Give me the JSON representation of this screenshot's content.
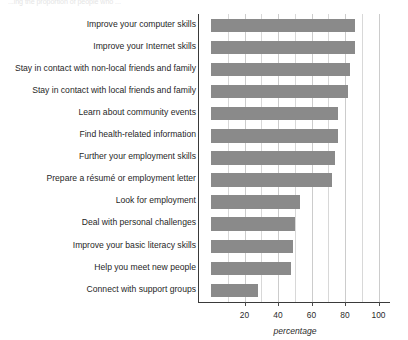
{
  "top_caption": "...ing the proportion of people who ...",
  "chart_data": {
    "type": "bar",
    "orientation": "horizontal",
    "title": "",
    "xlabel": "percentage",
    "ylabel": "",
    "xlim": [
      0,
      108
    ],
    "xticks": [
      20,
      40,
      60,
      80,
      100
    ],
    "gridlines": [
      10,
      20,
      30,
      40,
      50,
      60,
      70,
      80,
      90,
      100
    ],
    "grid": true,
    "legend": "none",
    "bar_color": "#8a8a8a",
    "categories": [
      "Improve your computer skills",
      "Improve your Internet skills",
      "Stay in contact with non-local friends and family",
      "Stay in contact with local friends and family",
      "Learn about community events",
      "Find health-related information",
      "Further your employment skills",
      "Prepare a résumé or employment letter",
      "Look for employment",
      "Deal with personal challenges",
      "Improve your basic literacy skills",
      "Help you meet new people",
      "Connect with support groups"
    ],
    "values": [
      86,
      86,
      83,
      82,
      76,
      76,
      74,
      72,
      53,
      50,
      49,
      48,
      28
    ]
  },
  "axis": {
    "tick_labels": [
      "20",
      "40",
      "60",
      "80",
      "100"
    ],
    "x_title": "percentage"
  }
}
